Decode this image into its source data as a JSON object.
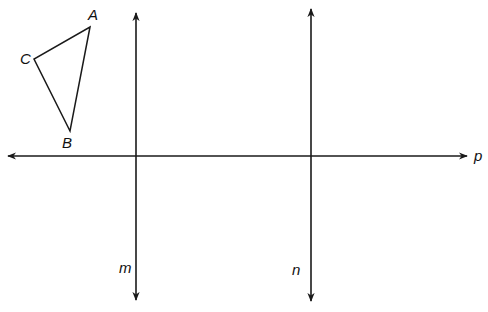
{
  "diagram": {
    "type": "geometry-reflection",
    "stroke_color": "#1a1a1a",
    "triangle": {
      "vertices": [
        {
          "name": "A",
          "x": 90,
          "y": 27,
          "label_x": 88,
          "label_y": 20
        },
        {
          "name": "B",
          "x": 70,
          "y": 131,
          "label_x": 62,
          "label_y": 148
        },
        {
          "name": "C",
          "x": 34,
          "y": 59,
          "label_x": 20,
          "label_y": 64
        }
      ]
    },
    "lines": [
      {
        "name": "m",
        "orientation": "vertical",
        "x": 136,
        "y1": 13,
        "y2": 300,
        "label_x": 119,
        "label_y": 273
      },
      {
        "name": "n",
        "orientation": "vertical",
        "x": 311,
        "y1": 9,
        "y2": 301,
        "label_x": 292,
        "label_y": 275
      },
      {
        "name": "p",
        "orientation": "horizontal",
        "y": 156,
        "x1": 8,
        "x2": 467,
        "label_x": 474,
        "label_y": 161
      }
    ]
  }
}
